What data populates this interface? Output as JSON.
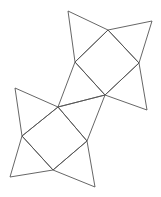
{
  "figure": {
    "background_color": "#ffffff",
    "stroke_color": "#555555",
    "stroke_width": 0.9,
    "canvas": {
      "width": 161,
      "height": 197
    },
    "junction_point": {
      "x": 105,
      "y": 95
    },
    "shapes": [
      {
        "name": "upper-star",
        "type": "four-pointed-star",
        "inner_square": [
          {
            "x": 108,
            "y": 30
          },
          {
            "x": 139,
            "y": 63
          },
          {
            "x": 105,
            "y": 95
          },
          {
            "x": 75,
            "y": 62
          }
        ],
        "spike_tips": [
          {
            "x": 68,
            "y": 11,
            "edge": [
              3,
              0
            ]
          },
          {
            "x": 152,
            "y": 21,
            "edge": [
              0,
              1
            ]
          },
          {
            "x": 147,
            "y": 110,
            "edge": [
              1,
              2
            ]
          },
          {
            "x": 58,
            "y": 107,
            "edge": [
              2,
              3
            ]
          }
        ]
      },
      {
        "name": "lower-star",
        "type": "four-pointed-star",
        "inner_square": [
          {
            "x": 58,
            "y": 107
          },
          {
            "x": 87,
            "y": 141
          },
          {
            "x": 53,
            "y": 170
          },
          {
            "x": 22,
            "y": 136
          }
        ],
        "spike_tips": [
          {
            "x": 15,
            "y": 88,
            "edge": [
              3,
              0
            ]
          },
          {
            "x": 105,
            "y": 95,
            "edge": [
              0,
              1
            ]
          },
          {
            "x": 95,
            "y": 187,
            "edge": [
              1,
              2
            ]
          },
          {
            "x": 10,
            "y": 177,
            "edge": [
              2,
              3
            ]
          }
        ]
      }
    ]
  }
}
